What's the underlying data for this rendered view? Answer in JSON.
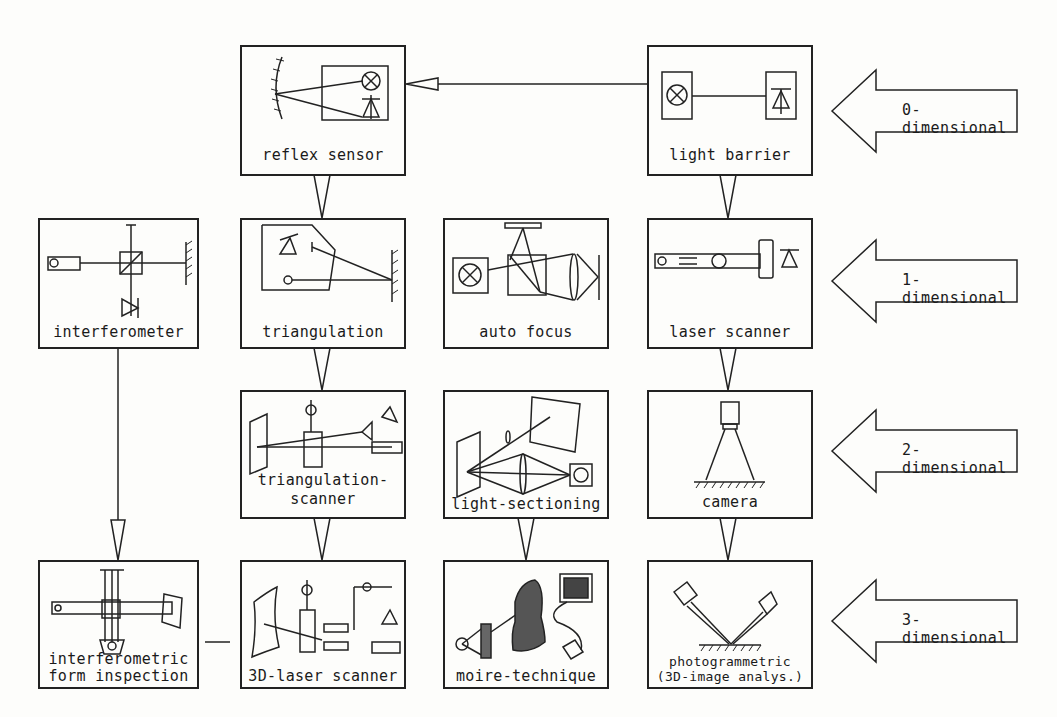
{
  "diagram": {
    "type": "classification of optical measurement techniques by dimensionality",
    "nodes": [
      {
        "id": "reflex-sensor",
        "label": "reflex sensor",
        "row": 0,
        "col": 2
      },
      {
        "id": "light-barrier",
        "label": "light barrier",
        "row": 0,
        "col": 4
      },
      {
        "id": "interferometer",
        "label": "interferometer",
        "row": 1,
        "col": 1
      },
      {
        "id": "triangulation",
        "label": "triangulation",
        "row": 1,
        "col": 2
      },
      {
        "id": "auto-focus",
        "label": "auto focus",
        "row": 1,
        "col": 3
      },
      {
        "id": "laser-scanner",
        "label": "laser scanner",
        "row": 1,
        "col": 4
      },
      {
        "id": "triangulation-scanner",
        "label_line1": "triangulation-",
        "label_line2": "scanner",
        "row": 2,
        "col": 2
      },
      {
        "id": "light-sectioning",
        "label": "light-sectioning",
        "row": 2,
        "col": 3
      },
      {
        "id": "camera",
        "label": "camera",
        "row": 2,
        "col": 4
      },
      {
        "id": "interferometric-form-inspection",
        "label_line1": "interferometric",
        "label_line2": "form inspection",
        "row": 3,
        "col": 1
      },
      {
        "id": "3d-laser-scanner",
        "label": "3D-laser scanner",
        "row": 3,
        "col": 2
      },
      {
        "id": "moire-technique",
        "label": "moire-technique",
        "row": 3,
        "col": 3
      },
      {
        "id": "photogrammetric",
        "label_line1": "photogrammetric",
        "label_line2": "(3D-image analys.)",
        "row": 3,
        "col": 4
      }
    ],
    "edges": [
      {
        "from": "light-barrier",
        "to": "reflex-sensor"
      },
      {
        "from": "reflex-sensor",
        "to": "triangulation"
      },
      {
        "from": "light-barrier",
        "to": "laser-scanner"
      },
      {
        "from": "triangulation",
        "to": "triangulation-scanner"
      },
      {
        "from": "laser-scanner",
        "to": "camera"
      },
      {
        "from": "triangulation-scanner",
        "to": "3d-laser-scanner"
      },
      {
        "from": "light-sectioning",
        "to": "moire-technique"
      },
      {
        "from": "camera",
        "to": "photogrammetric"
      },
      {
        "from": "interferometer",
        "to": "interferometric-form-inspection"
      },
      {
        "from": "interferometric-form-inspection",
        "to": "3d-laser-scanner",
        "style": "line"
      }
    ],
    "dimension_arrows": [
      {
        "label": "0-dimensional",
        "row": 0
      },
      {
        "label": "1-dimensional",
        "row": 1
      },
      {
        "label": "2-dimensional",
        "row": 2
      },
      {
        "label": "3-dimensional",
        "row": 3
      }
    ],
    "icons": {
      "reflex-sensor": [
        "mirror-icon",
        "lamp-icon",
        "photodiode-icon"
      ],
      "light-barrier": [
        "lamp-icon",
        "photodiode-icon"
      ],
      "interferometer": [
        "laser-icon",
        "beam-splitter-icon",
        "mirror-icon",
        "photodiode-icon"
      ],
      "triangulation": [
        "photodiode-icon",
        "light-source-icon",
        "mirror-icon"
      ],
      "auto-focus": [
        "lamp-icon",
        "beam-splitter-icon",
        "lens-icon",
        "mirror-icon"
      ],
      "laser-scanner": [
        "laser-icon",
        "scanner-mirror-icon",
        "photodiode-icon"
      ],
      "camera": [
        "camera-icon",
        "surface-icon"
      ],
      "photogrammetric": [
        "camera-icon",
        "camera-icon",
        "surface-icon"
      ]
    },
    "line_color": "#222222",
    "background": "#fdfdfb"
  }
}
